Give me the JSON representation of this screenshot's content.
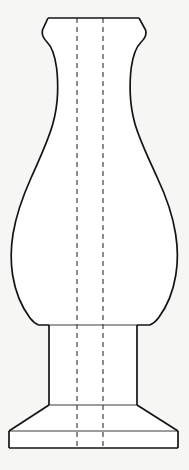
{
  "figure": {
    "kind": "technical-line-drawing",
    "background_color": "#f6f6f5",
    "object_fill_color": "#ffffff",
    "outline_color": "#141414",
    "construction_line_color": "#4a4a4a",
    "canvas": {
      "width": 189,
      "height": 470
    },
    "title": "",
    "caption": "",
    "labels": []
  },
  "geometry": {
    "rim": {
      "name": "flared-rim",
      "top_y": 18,
      "top_left_x": 48,
      "top_right_x": 139,
      "flare_left_x": 42,
      "flare_right_x": 146,
      "flare_y": 30,
      "bottom_y": 44
    },
    "neck": {
      "name": "concave-neck",
      "start_y": 44,
      "narrowest_y": 92,
      "narrowest_left_x": 57,
      "narrowest_right_x": 130,
      "end_y": 150
    },
    "body": {
      "name": "teardrop-body",
      "start_y": 150,
      "widest_y": 266,
      "widest_left_x": 11,
      "widest_right_x": 176,
      "end_y": 325
    },
    "stem": {
      "name": "cylindrical-stem",
      "top_y": 325,
      "bottom_y": 405,
      "left_x": 49,
      "right_x": 137
    },
    "base_flare": {
      "name": "trapezoid-base-flare",
      "top_y": 405,
      "bottom_y": 431,
      "top_left_x": 49,
      "top_right_x": 137,
      "bottom_left_x": 9,
      "bottom_right_x": 178
    },
    "foot": {
      "name": "rectangular-foot",
      "top_y": 431,
      "bottom_y": 448,
      "left_x": 9,
      "right_x": 178
    },
    "center_lines": {
      "name": "dashed-construction-lines",
      "left_x": 77,
      "right_x": 103,
      "top_y": 18,
      "bottom_y": 448,
      "dash_pattern": "5 4"
    }
  },
  "paths": {
    "left_profile": "M 48 18 L 42.5 30 C 41.5 34 43 38 47 42 C 51.5 46.5 55 56 56.6 68 C 57.6 76 57.8 85 57.6 93 C 57.2 104 55.6 114 52.8 124 C 48 141 40 158 31 178 C 22.5 197 16 216 13 234 C 10.6 249 10.6 262 12.6 275 C 15 290 21 306 30 318 C 32.8 321.6 35.6 323.8 38.6 325 L 49 325",
    "right_profile": "M 139 18 L 145.6 30 C 146.8 34 145.4 38 141.2 42 C 136.4 46.6 132.8 56 131.2 68 C 130.2 76 130 85 130.2 93 C 130.6 104 132.2 114 135 124 C 140 141 148.4 158 157.4 178 C 166.4 197 172.8 216 175.6 234 C 178 249 178 262 175.8 275 C 173.4 290 167.4 306 158.4 318 C 155.6 321.6 152.8 323.8 149.8 325 L 137 325",
    "rim_top": "M 48 18 L 139 18",
    "stem_left": "M 49 325 L 49 405",
    "stem_right": "M 137 325 L 137 405",
    "stem_top_divider": "M 49 325 L 137 325",
    "stem_bottom_divider": "M 49 405 L 137 405",
    "base_flare_left": "M 49 405 L 9 431",
    "base_flare_right": "M 137 405 L 178 431",
    "foot_top": "M 9 431 L 178 431",
    "foot_left": "M 9 431 L 9 448",
    "foot_right": "M 178 431 L 178 448",
    "foot_bottom": "M 9 448 L 178 448",
    "body_fill": "M 48 18 L 139 18 L 145.6 30 C 146.8 34 145.4 38 141.2 42 C 136.4 46.6 132.8 56 131.2 68 C 130.2 76 130 85 130.2 93 C 130.6 104 132.2 114 135 124 C 140 141 148.4 158 157.4 178 C 166.4 197 172.8 216 175.6 234 C 178 249 178 262 175.8 275 C 173.4 290 167.4 306 158.4 318 C 155.6 321.6 152.8 323.8 149.8 325 L 137 325 L 137 405 L 178 431 L 178 448 L 9 448 L 9 431 L 49 405 L 49 325 L 38.6 325 C 35.6 323.8 32.8 321.6 30 318 C 21 306 15 290 12.6 275 C 10.6 262 10.6 249 13 234 C 16 216 22.5 197 31 178 C 40 158 48 141 52.8 124 C 55.6 114 57.2 104 57.6 93 C 57.8 85 57.6 76 56.6 68 C 55 56 51.5 46.5 47 42 C 43 38 41.5 34 42.5 30 Z"
  }
}
